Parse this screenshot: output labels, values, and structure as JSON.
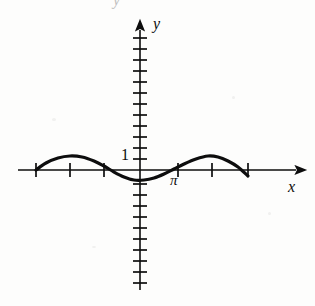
{
  "figure": {
    "kind": "cartesian-graph",
    "background_color": "#fdfdfc",
    "ink_color": "#0d0d0d",
    "labels": {
      "y_axis": "y",
      "x_axis": "x",
      "unit_marker": "1",
      "pi_marker": "π",
      "partial_top_glyph": "y"
    }
  },
  "chart_data": {
    "type": "line",
    "title": "",
    "subtitle": "",
    "xlabel": "x",
    "ylabel": "y",
    "legend": [],
    "grid": false,
    "annotations": [
      {
        "text": "1",
        "x": -0.25,
        "y": 1.0,
        "note": "unit tick label on y-axis"
      },
      {
        "text": "π",
        "x": 3.1416,
        "y": -0.35,
        "note": "tick label on x-axis"
      }
    ],
    "axes": {
      "x_axis_drawn_from_px": 18,
      "x_axis_drawn_to_px": 300,
      "y_axis_drawn_from_px": 290,
      "y_axis_drawn_to_px": 24,
      "origin_px": {
        "x": 140,
        "y": 170
      },
      "px_per_tick_x": 34,
      "px_per_tick_y": 11,
      "x_arrow": "right",
      "y_arrow": "up",
      "xlim": [
        -3.7,
        4.9
      ],
      "ylim": [
        -3.4,
        3.6
      ],
      "x_tick_values": [
        -3.1416,
        -2.0944,
        -1.0472,
        1.0472,
        2.0944,
        3.1416
      ],
      "x_tick_px": [
        36,
        70,
        104,
        178,
        212,
        248
      ],
      "y_tick_count_above_origin": 12,
      "y_tick_count_below_origin": 11,
      "unit_tick_y_px": 159
    },
    "series": [
      {
        "name": "curve",
        "description": "sine-like wave drawn with heavy pen stroke, one full period visible",
        "amplitude": 1.0,
        "period_px": 212,
        "x_start_px": 36,
        "x_end_px": 248,
        "stroke_width_px": 3.2,
        "x": [
          -3.1416,
          -2.7925,
          -2.4435,
          -2.0944,
          -1.7453,
          -1.3963,
          -1.0472,
          -0.6981,
          -0.3491,
          0.0,
          0.3491,
          0.6981,
          1.0472,
          1.3963,
          1.7453,
          2.0944,
          2.4435,
          2.7925,
          3.1416
        ],
        "values": [
          0.0,
          0.34,
          0.64,
          0.87,
          0.98,
          0.98,
          0.87,
          0.64,
          0.34,
          0.0,
          -0.34,
          -0.64,
          -0.87,
          -0.98,
          -0.98,
          -0.87,
          -0.64,
          -0.34,
          0.0
        ],
        "points_px": [
          [
            36,
            170
          ],
          [
            46,
            163
          ],
          [
            58,
            158
          ],
          [
            70,
            156
          ],
          [
            82,
            157
          ],
          [
            94,
            161
          ],
          [
            104,
            166
          ],
          [
            114,
            172
          ],
          [
            124,
            177
          ],
          [
            134,
            180
          ],
          [
            144,
            180
          ],
          [
            154,
            178
          ],
          [
            164,
            174
          ],
          [
            174,
            169
          ],
          [
            184,
            164
          ],
          [
            196,
            159
          ],
          [
            208,
            156
          ],
          [
            218,
            157
          ],
          [
            228,
            161
          ],
          [
            238,
            167
          ],
          [
            248,
            176
          ]
        ]
      }
    ]
  }
}
